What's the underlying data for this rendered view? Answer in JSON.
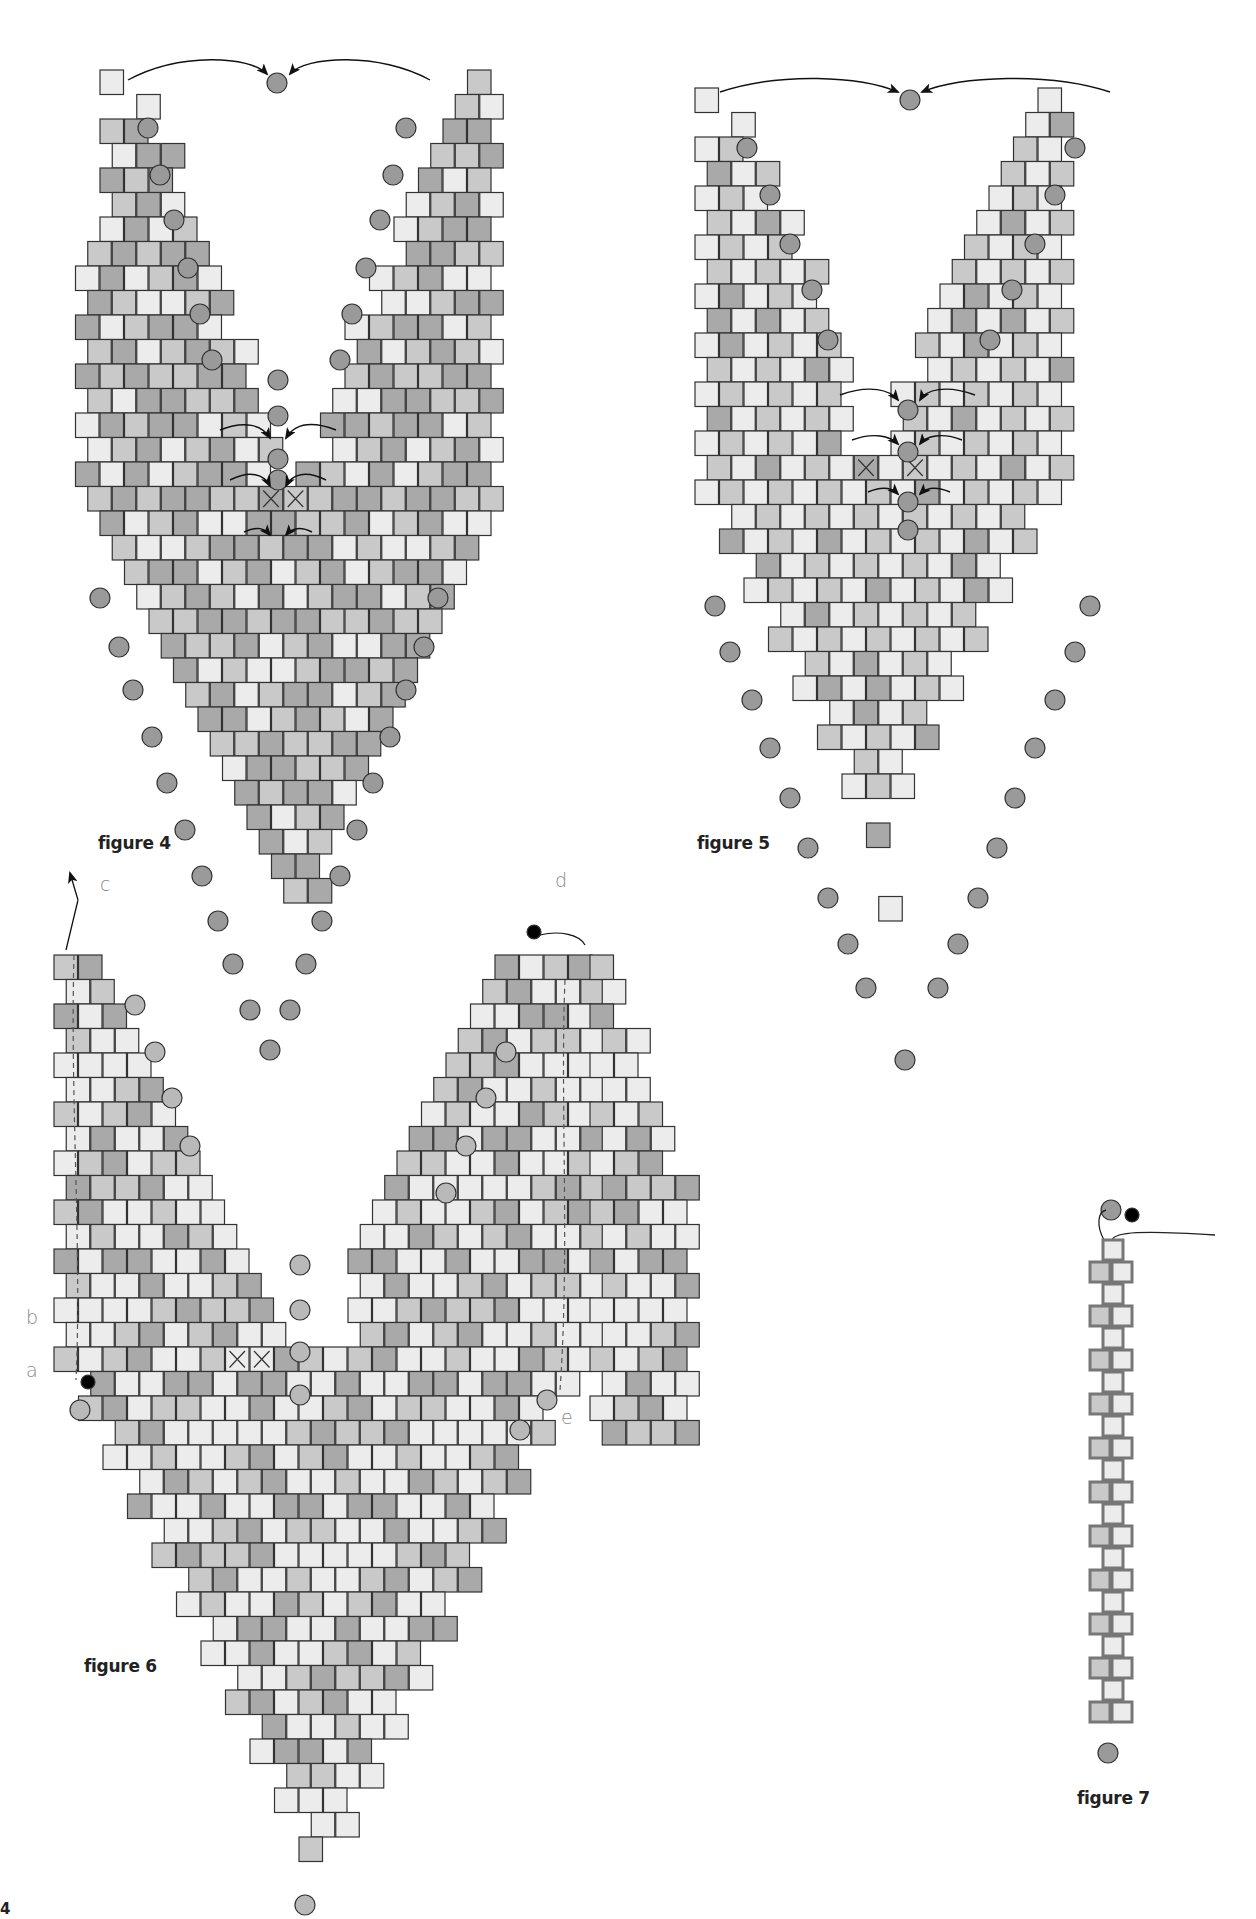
{
  "page": {
    "number": "4",
    "background": "#ffffff"
  },
  "colors": {
    "bead_light": "#ececec",
    "bead_mid": "#c9c9c9",
    "bead_dark": "#a9a9a9",
    "bead_stroke": "#333333",
    "round_bead": "#9a9a9a",
    "round_bead_light": "#b9b9b9",
    "thread": "#222222",
    "knot": "#000000",
    "label_gray": "#888888"
  },
  "figures": [
    {
      "id": "figure-4",
      "label": "figure 4",
      "label_pos": [
        98,
        845
      ],
      "description": "Two tapered brick-stitch columns joined at top and center by round beads, forming a V/heart-shaped point with X-marked beads"
    },
    {
      "id": "figure-5",
      "label": "figure 5",
      "label_pos": [
        697,
        845
      ],
      "description": "Same V construction as figure 4 with lighter checker coloring"
    },
    {
      "id": "figure-6",
      "label": "figure 6",
      "label_pos": [
        84,
        1668
      ],
      "description": "Wide V panel with thread path steps a–e along edges",
      "step_labels": [
        {
          "text": "c",
          "pos": [
            100,
            897
          ]
        },
        {
          "text": "d",
          "pos": [
            555,
            893
          ]
        },
        {
          "text": "b",
          "pos": [
            26,
            1330
          ]
        },
        {
          "text": "a",
          "pos": [
            26,
            1383
          ]
        },
        {
          "text": "e",
          "pos": [
            561,
            1430
          ]
        }
      ]
    },
    {
      "id": "figure-7",
      "label": "figure 7",
      "label_pos": [
        1077,
        1800
      ],
      "description": "Narrow two-bead ladder strap with round bead ends and thread exiting"
    }
  ],
  "markers": {
    "x_mark": "X"
  }
}
